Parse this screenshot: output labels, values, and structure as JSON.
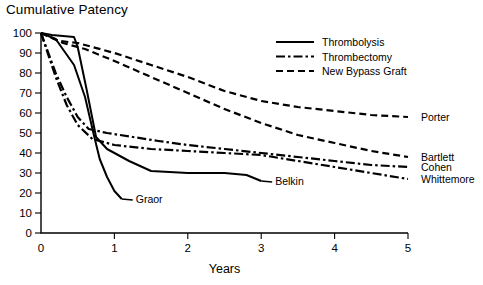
{
  "figure": {
    "title": "Cumulative Patency",
    "caption": ""
  },
  "chart_data": {
    "type": "line",
    "title": "Cumulative Patency",
    "xlabel": "Years",
    "ylabel": "",
    "xlim": [
      0,
      5
    ],
    "ylim": [
      0,
      100
    ],
    "xticks": [
      0,
      1,
      2,
      3,
      4,
      5
    ],
    "yticks": [
      0,
      10,
      20,
      30,
      40,
      50,
      60,
      70,
      80,
      90,
      100
    ],
    "grid": false,
    "legend_position": "top-right",
    "legend": [
      {
        "label": "Thrombolysis",
        "style": "solid"
      },
      {
        "label": "Thrombectomy",
        "style": "dash-dot"
      },
      {
        "label": "New Bypass Graft",
        "style": "dashed"
      }
    ],
    "series": [
      {
        "name": "Porter",
        "style": "dashed",
        "group": "New Bypass Graft",
        "points": [
          [
            0,
            100
          ],
          [
            0.25,
            96
          ],
          [
            0.5,
            95
          ],
          [
            1,
            90
          ],
          [
            1.5,
            84
          ],
          [
            2,
            78
          ],
          [
            2.5,
            71
          ],
          [
            3,
            66
          ],
          [
            3.5,
            63
          ],
          [
            4,
            61
          ],
          [
            4.5,
            59
          ],
          [
            5,
            58
          ]
        ]
      },
      {
        "name": "Bartlett",
        "style": "dashed",
        "group": "New Bypass Graft",
        "points": [
          [
            0,
            100
          ],
          [
            0.3,
            95
          ],
          [
            0.6,
            92
          ],
          [
            1,
            86
          ],
          [
            1.5,
            78
          ],
          [
            2,
            70
          ],
          [
            2.5,
            62
          ],
          [
            3,
            55
          ],
          [
            3.5,
            49
          ],
          [
            4,
            45
          ],
          [
            4.5,
            41
          ],
          [
            5,
            38
          ]
        ]
      },
      {
        "name": "Cohen",
        "style": "dash-dot",
        "group": "Thrombectomy",
        "points": [
          [
            0,
            100
          ],
          [
            0.2,
            80
          ],
          [
            0.35,
            68
          ],
          [
            0.5,
            58
          ],
          [
            0.65,
            52
          ],
          [
            0.9,
            50
          ],
          [
            1.25,
            48
          ],
          [
            1.6,
            46
          ],
          [
            2,
            44
          ],
          [
            2.5,
            42
          ],
          [
            3,
            40
          ],
          [
            3.5,
            38
          ],
          [
            4,
            36
          ],
          [
            4.5,
            34
          ],
          [
            5,
            33
          ]
        ]
      },
      {
        "name": "Whittemore",
        "style": "dash-dot",
        "group": "Thrombectomy",
        "points": [
          [
            0,
            100
          ],
          [
            0.2,
            78
          ],
          [
            0.35,
            64
          ],
          [
            0.5,
            54
          ],
          [
            0.7,
            47
          ],
          [
            1,
            44
          ],
          [
            1.5,
            42
          ],
          [
            2,
            41
          ],
          [
            2.5,
            40
          ],
          [
            3,
            39
          ],
          [
            3.5,
            36
          ],
          [
            4,
            33
          ],
          [
            4.5,
            30
          ],
          [
            5,
            27
          ]
        ]
      },
      {
        "name": "Belkin",
        "style": "solid",
        "group": "Thrombolysis",
        "points": [
          [
            0,
            100
          ],
          [
            0.15,
            99
          ],
          [
            0.45,
            98
          ],
          [
            0.5,
            93
          ],
          [
            0.62,
            72
          ],
          [
            0.75,
            48
          ],
          [
            0.9,
            42
          ],
          [
            1.2,
            36
          ],
          [
            1.5,
            31
          ],
          [
            2,
            30
          ],
          [
            2.5,
            30
          ],
          [
            2.8,
            29
          ],
          [
            3,
            26
          ]
        ]
      },
      {
        "name": "Graor",
        "style": "solid",
        "group": "Thrombolysis",
        "points": [
          [
            0,
            100
          ],
          [
            0.2,
            97
          ],
          [
            0.45,
            84
          ],
          [
            0.6,
            68
          ],
          [
            0.72,
            49
          ],
          [
            0.8,
            37
          ],
          [
            0.9,
            28
          ],
          [
            1.0,
            21
          ],
          [
            1.1,
            17
          ]
        ]
      }
    ],
    "annotations": [
      {
        "text": "Porter",
        "x": 5.0,
        "y": 58
      },
      {
        "text": "Bartlett",
        "x": 5.0,
        "y": 38
      },
      {
        "text": "Cohen",
        "x": 5.0,
        "y": 33
      },
      {
        "text": "Whittemore",
        "x": 5.0,
        "y": 27
      },
      {
        "text": "Belkin",
        "x": 3.0,
        "y": 26
      },
      {
        "text": "Graor",
        "x": 1.1,
        "y": 17
      }
    ]
  }
}
